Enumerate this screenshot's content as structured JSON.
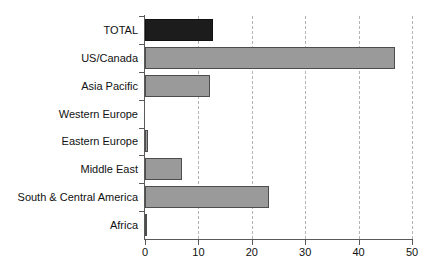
{
  "chart_data": {
    "type": "bar",
    "orientation": "horizontal",
    "title": "",
    "subtitle": "",
    "xlabel": "",
    "ylabel": "",
    "categories": [
      "TOTAL",
      "US/Canada",
      "Asia Pacific",
      "Western Europe",
      "Eastern Europe",
      "Middle East",
      "South & Central America",
      "Africa"
    ],
    "values": [
      12.7,
      46.8,
      12.2,
      0.0,
      0.6,
      6.9,
      23.2,
      0.3
    ],
    "xlim": [
      0,
      50
    ],
    "xticks": [
      0,
      10,
      20,
      30,
      40,
      50
    ],
    "xtick_labels": [
      "0",
      "10",
      "20",
      "30",
      "40",
      "50"
    ],
    "grid": "vertical-dashed",
    "legend": "none",
    "bar_colors": [
      "#1c1c1c",
      "#9a9a9a",
      "#9a9a9a",
      "#9a9a9a",
      "#9a9a9a",
      "#9a9a9a",
      "#9a9a9a",
      "#9a9a9a"
    ],
    "highlight_category": "TOTAL",
    "colors": {
      "total_bar": "#1c1c1c",
      "region_bar": "#9a9a9a",
      "bar_border": "#4d4d4d",
      "axis": "#5a5a5a",
      "gridline": "#b4b4b4",
      "text": "#111111",
      "background": "#ffffff"
    }
  }
}
